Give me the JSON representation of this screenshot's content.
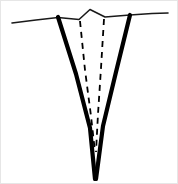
{
  "figure": {
    "type": "line-drawing",
    "width": 178,
    "height": 184,
    "background_color": "#ffffff",
    "ink_color": "#000000",
    "border_color": "#e6e6e6",
    "caption": ""
  },
  "elements": {
    "ground_surface_left": {
      "name": "ground-surface-left",
      "description": "thin near-horizontal surface line on the left of the wedge",
      "stroke_width": 1.6,
      "color": "#1a1a1a",
      "points": "12,23 36,20 58,17.5"
    },
    "ground_surface_right": {
      "name": "ground-surface-right",
      "description": "thin near-horizontal surface line on the right of the wedge",
      "stroke_width": 1.6,
      "color": "#1a1a1a",
      "points": "130,15 152,13.5 168,13"
    },
    "surface_bump": {
      "name": "surface-bump",
      "description": "small raised mound between the two wedge shoulders",
      "stroke_width": 1.6,
      "color": "#1a1a1a",
      "points": "58,17.5 79,19.5 90,9.5 105,17 130,15"
    },
    "wedge_left_wall": {
      "name": "wedge-left-wall",
      "description": "thick solid left boundary of the wedge tapering to the tip",
      "stroke_width": 4.2,
      "color": "#000000",
      "points": "58,17 76,74 90,128 95,179"
    },
    "wedge_right_wall": {
      "name": "wedge-right-wall",
      "description": "thick solid right boundary of the wedge tapering to the tip",
      "stroke_width": 4.2,
      "color": "#000000",
      "points": "130,15 116,72 103,126 96,179"
    },
    "inner_dashed_left": {
      "name": "inner-dashed-left-boundary",
      "description": "dashed inner boundary on the left side converging downward",
      "stroke_width": 1.8,
      "color": "#000000",
      "dash_pattern": "6 5",
      "points": "80,21 85,70 91,116 95,152"
    },
    "inner_dashed_right": {
      "name": "inner-dashed-right-boundary",
      "description": "dashed inner boundary on the right side converging downward",
      "stroke_width": 1.8,
      "color": "#000000",
      "dash_pattern": "6 5",
      "points": "104,19 101,68 98,114 96,152"
    }
  },
  "labels": {
    "items": []
  }
}
